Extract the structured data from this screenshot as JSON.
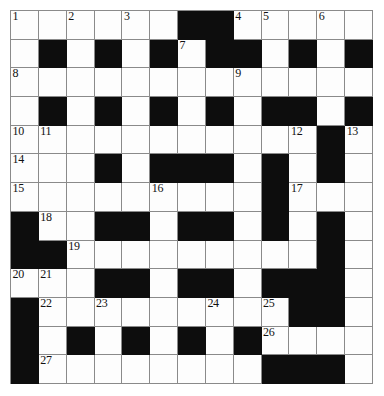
{
  "puzzle": {
    "kind": "crossword-grid",
    "title": "Crossword Puzzle Grid",
    "rows": 13,
    "columns": 13,
    "cell_size_px": 27.8,
    "colors": {
      "block": "#0d0d0d",
      "open": "#fdfdfd",
      "gridline": "#8a8a8a",
      "number_text": "#111111",
      "page_background": "#ffffff"
    },
    "numbering_scheme": "standard-crossword",
    "highest_clue_number": 27,
    "clue_numbers": [
      1,
      2,
      3,
      4,
      5,
      6,
      7,
      8,
      9,
      10,
      11,
      12,
      13,
      14,
      15,
      16,
      17,
      18,
      19,
      20,
      21,
      22,
      23,
      24,
      25,
      26,
      27
    ],
    "legend": {
      "0": "open white square",
      "1": "blocked black square"
    },
    "grid": [
      [
        0,
        0,
        0,
        0,
        0,
        0,
        1,
        1,
        0,
        0,
        0,
        0,
        0
      ],
      [
        0,
        1,
        0,
        1,
        0,
        1,
        0,
        1,
        1,
        0,
        1,
        0,
        1
      ],
      [
        0,
        0,
        0,
        0,
        0,
        0,
        0,
        0,
        0,
        0,
        0,
        0,
        0
      ],
      [
        0,
        1,
        0,
        1,
        0,
        1,
        0,
        1,
        0,
        1,
        1,
        0,
        1
      ],
      [
        0,
        0,
        0,
        0,
        0,
        0,
        0,
        0,
        0,
        0,
        0,
        1,
        0
      ],
      [
        0,
        0,
        0,
        1,
        0,
        1,
        1,
        1,
        0,
        1,
        0,
        1,
        0
      ],
      [
        0,
        0,
        0,
        0,
        0,
        0,
        0,
        0,
        0,
        1,
        0,
        0,
        0
      ],
      [
        1,
        0,
        0,
        1,
        1,
        0,
        1,
        1,
        0,
        1,
        0,
        1,
        0
      ],
      [
        1,
        1,
        0,
        0,
        0,
        0,
        0,
        0,
        0,
        0,
        0,
        1,
        0
      ],
      [
        0,
        0,
        0,
        1,
        1,
        0,
        1,
        1,
        0,
        1,
        1,
        1,
        0
      ],
      [
        1,
        0,
        0,
        0,
        0,
        0,
        0,
        0,
        0,
        0,
        1,
        1,
        0
      ],
      [
        1,
        0,
        1,
        0,
        1,
        0,
        1,
        0,
        1,
        0,
        0,
        0,
        0
      ],
      [
        1,
        0,
        0,
        0,
        0,
        0,
        0,
        0,
        0,
        1,
        1,
        1,
        0
      ]
    ],
    "numbers": [
      {
        "n": 1,
        "row": 1,
        "col": 1
      },
      {
        "n": 2,
        "row": 1,
        "col": 3
      },
      {
        "n": 3,
        "row": 1,
        "col": 5
      },
      {
        "n": 4,
        "row": 1,
        "col": 9
      },
      {
        "n": 5,
        "row": 1,
        "col": 10
      },
      {
        "n": 6,
        "row": 1,
        "col": 12
      },
      {
        "n": 7,
        "row": 2,
        "col": 7
      },
      {
        "n": 8,
        "row": 3,
        "col": 1
      },
      {
        "n": 9,
        "row": 3,
        "col": 9
      },
      {
        "n": 10,
        "row": 5,
        "col": 1
      },
      {
        "n": 11,
        "row": 5,
        "col": 2
      },
      {
        "n": 12,
        "row": 5,
        "col": 11
      },
      {
        "n": 13,
        "row": 5,
        "col": 13
      },
      {
        "n": 14,
        "row": 6,
        "col": 1
      },
      {
        "n": 15,
        "row": 7,
        "col": 1
      },
      {
        "n": 16,
        "row": 7,
        "col": 6
      },
      {
        "n": 17,
        "row": 7,
        "col": 11
      },
      {
        "n": 18,
        "row": 8,
        "col": 2
      },
      {
        "n": 19,
        "row": 9,
        "col": 3
      },
      {
        "n": 20,
        "row": 10,
        "col": 1
      },
      {
        "n": 21,
        "row": 10,
        "col": 2
      },
      {
        "n": 22,
        "row": 11,
        "col": 2
      },
      {
        "n": 23,
        "row": 11,
        "col": 4
      },
      {
        "n": 24,
        "row": 11,
        "col": 8
      },
      {
        "n": 25,
        "row": 11,
        "col": 10
      },
      {
        "n": 26,
        "row": 12,
        "col": 10
      },
      {
        "n": 27,
        "row": 13,
        "col": 2
      }
    ],
    "entries": []
  }
}
